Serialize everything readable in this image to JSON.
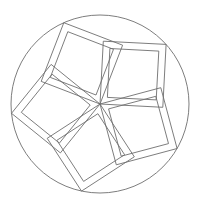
{
  "diagram": {
    "type": "geometric-line-drawing",
    "stroke_color": "#6e6e6e",
    "background_color": "#ffffff",
    "circle": {
      "cx": 100,
      "cy": 104,
      "r": 89
    },
    "center": {
      "x": 100,
      "y": 104
    },
    "square_count": 5,
    "outer_vertex_angles_deg": [
      -114,
      -42,
      30,
      102,
      174
    ],
    "outer_diagonal": 89,
    "inner_inset": 7
  }
}
